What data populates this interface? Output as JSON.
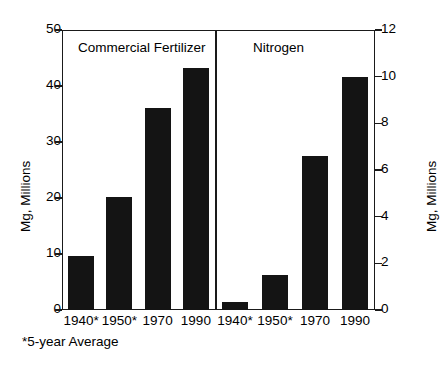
{
  "chart_data": {
    "type": "bar",
    "title": "",
    "panels": [
      {
        "name": "Commercial Fertilizer",
        "categories": [
          "1940*",
          "1950*",
          "1970",
          "1990"
        ],
        "values": [
          9.7,
          20.2,
          36.0,
          43.2
        ],
        "ylabel": "Mg, Millions",
        "ylim": [
          0,
          50
        ],
        "yticks": [
          0,
          10,
          20,
          30,
          40,
          50
        ],
        "axis_side": "left"
      },
      {
        "name": "Nitrogen",
        "categories": [
          "1940*",
          "1950*",
          "1970",
          "1990"
        ],
        "values": [
          0.35,
          1.5,
          6.6,
          10.0
        ],
        "ylabel": "Mg, Millions",
        "ylim": [
          0,
          12
        ],
        "yticks": [
          0,
          2,
          4,
          6,
          8,
          10,
          12
        ],
        "axis_side": "right"
      }
    ],
    "xlabel": "",
    "grid": false,
    "legend": false,
    "footnote": "*5-year Average",
    "bar_color": "#141414"
  },
  "axes": {
    "left": {
      "label": "Mg, Millions",
      "ticks": [
        "50",
        "40",
        "30",
        "20",
        "10",
        "0"
      ]
    },
    "right": {
      "label": "Mg, Millions",
      "ticks": [
        "12",
        "10",
        "8",
        "6",
        "4",
        "2",
        "0"
      ]
    }
  },
  "panel_titles": {
    "left": "Commercial Fertilizer",
    "right": "Nitrogen"
  },
  "xticks": [
    "1940*",
    "1950*",
    "1970",
    "1990",
    "1940*",
    "1950*",
    "1970",
    "1990"
  ],
  "footnote": "*5-year Average"
}
